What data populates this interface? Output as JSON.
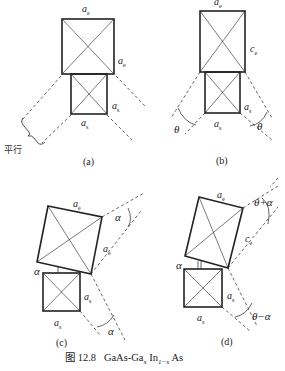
{
  "figure": {
    "number_label": "图 12.8",
    "title_prefix": "GaAs-Ga",
    "title_sub1": "x",
    "title_mid": " In",
    "title_sub2": "1−x",
    "title_suffix": " As"
  },
  "panels": {
    "a": {
      "caption": "(a)",
      "label_top": "a",
      "label_top_sub": "e",
      "label_right": "a",
      "label_right_sub": "e",
      "label_small_right": "a",
      "label_small_right_sub": "s",
      "label_small_bottom": "a",
      "label_small_bottom_sub": "s",
      "annotation": "平行"
    },
    "b": {
      "caption": "(b)",
      "label_top": "a",
      "label_top_sub": "e",
      "label_right": "c",
      "label_right_sub": "e",
      "label_small_right": "a",
      "label_small_right_sub": "s",
      "label_small_bottom": "a",
      "label_small_bottom_sub": "s",
      "angle_left": "θ",
      "angle_right": "θ"
    },
    "c": {
      "caption": "(c)",
      "label_top": "a",
      "label_top_sub": "e",
      "label_right": "a",
      "label_right_sub": "e",
      "label_small_right": "a",
      "label_small_right_sub": "s",
      "label_small_bottom": "a",
      "label_small_bottom_sub": "s",
      "angle_top": "α",
      "angle_left": "α",
      "angle_bottom": "α"
    },
    "d": {
      "caption": "(d)",
      "label_top": "a",
      "label_top_sub": "e",
      "label_right": "c",
      "label_right_sub": "e",
      "label_small_right": "a",
      "label_small_right_sub": "s",
      "label_small_bottom": "a",
      "label_small_bottom_sub": "s",
      "angle_top": "θ+α",
      "angle_left": "α",
      "angle_bottom": "θ−α"
    }
  }
}
